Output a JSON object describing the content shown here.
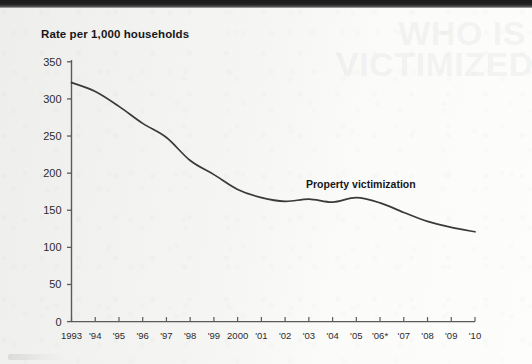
{
  "chart_data": {
    "type": "line",
    "title": "Rate per 1,000 households",
    "xlabel": "",
    "ylabel": "Rate per 1,000 households",
    "ylim": [
      0,
      350
    ],
    "ytick_step": 50,
    "yticks": [
      "0",
      "50",
      "100",
      "150",
      "200",
      "250",
      "300",
      "350"
    ],
    "grid": false,
    "legend_position": "inline-right",
    "series": [
      {
        "name": "Property victimization",
        "values": [
          322,
          310,
          290,
          267,
          248,
          217,
          198,
          178,
          167,
          162,
          165,
          161,
          167,
          160,
          147,
          135,
          127,
          121
        ]
      }
    ],
    "categories": [
      "1993",
      "1994",
      "1995",
      "1996",
      "1997",
      "1998",
      "1999",
      "2000",
      "2001",
      "2002",
      "2003",
      "2004",
      "2005",
      "2006",
      "2007",
      "2008",
      "2009",
      "2010"
    ],
    "xtick_labels": [
      "1993",
      "'94",
      "'95",
      "'96",
      "'97",
      "'98",
      "'99",
      "2000",
      "'01",
      "'02",
      "'03",
      "'04",
      "'05",
      "'06*",
      "'07",
      "'08",
      "'09",
      "'10"
    ],
    "annotations": [
      {
        "text": "Property victimization",
        "x": "2004",
        "y": 185
      }
    ],
    "line_color": "#3a3a3c",
    "axis_color": "#5a5a5c"
  },
  "page": {
    "background_color": "#f3f3f1",
    "ghost_text": "WHO IS\nVICTIMIZED?"
  },
  "icons": {
    "line_series": "line-chart-icon"
  }
}
